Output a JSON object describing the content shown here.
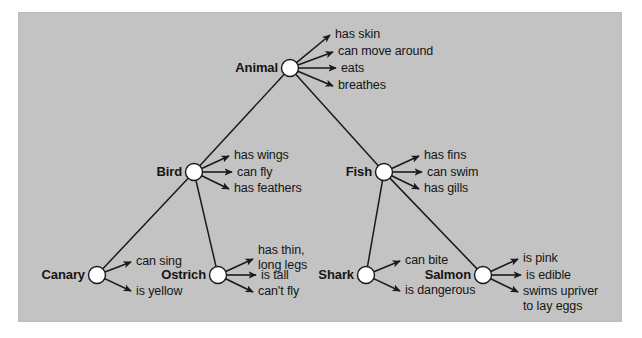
{
  "figure": {
    "type": "semantic-network-diagram",
    "panel": {
      "background_color": "#c3c3c3",
      "border_color": "#bcbcbc",
      "x": 18,
      "y": 12,
      "width": 604,
      "height": 310
    },
    "style": {
      "node_fill": "#ffffff",
      "node_stroke": "#1a1a1a",
      "line_color": "#1a1a1a",
      "text_color": "#151515",
      "node_radius": 8.5
    }
  },
  "nodes": [
    {
      "id": "animal",
      "label": "Animal",
      "x": 290,
      "y": 68,
      "label_x": 278,
      "label_y": 61,
      "level": 0
    },
    {
      "id": "bird",
      "label": "Bird",
      "x": 194,
      "y": 172,
      "label_x": 182,
      "label_y": 165,
      "level": 1
    },
    {
      "id": "fish",
      "label": "Fish",
      "x": 384,
      "y": 172,
      "label_x": 372,
      "label_y": 165,
      "level": 1
    },
    {
      "id": "canary",
      "label": "Canary",
      "x": 97,
      "y": 275,
      "label_x": 85,
      "label_y": 268,
      "level": 2
    },
    {
      "id": "ostrich",
      "label": "Ostrich",
      "x": 218,
      "y": 275,
      "label_x": 206,
      "label_y": 268,
      "level": 2
    },
    {
      "id": "shark",
      "label": "Shark",
      "x": 366,
      "y": 275,
      "label_x": 354,
      "label_y": 268,
      "level": 2
    },
    {
      "id": "salmon",
      "label": "Salmon",
      "x": 483,
      "y": 275,
      "label_x": 471,
      "label_y": 268,
      "level": 2
    }
  ],
  "isa_links": [
    {
      "from": "bird",
      "to": "animal"
    },
    {
      "from": "fish",
      "to": "animal"
    },
    {
      "from": "canary",
      "to": "bird"
    },
    {
      "from": "ostrich",
      "to": "bird"
    },
    {
      "from": "shark",
      "to": "fish"
    },
    {
      "from": "salmon",
      "to": "fish"
    }
  ],
  "properties": [
    {
      "node": "animal",
      "items": [
        {
          "text": "has skin",
          "tip_x": 330,
          "tip_y": 35,
          "text_x": 335,
          "text_y": 27
        },
        {
          "text": "can move around",
          "tip_x": 333,
          "tip_y": 52,
          "text_x": 338,
          "text_y": 44
        },
        {
          "text": "eats",
          "tip_x": 336,
          "tip_y": 68,
          "text_x": 341,
          "text_y": 61
        },
        {
          "text": "breathes",
          "tip_x": 333,
          "tip_y": 86,
          "text_x": 338,
          "text_y": 78
        }
      ]
    },
    {
      "node": "bird",
      "items": [
        {
          "text": "has wings",
          "tip_x": 229,
          "tip_y": 156,
          "text_x": 234,
          "text_y": 148
        },
        {
          "text": "can fly",
          "tip_x": 232,
          "tip_y": 172,
          "text_x": 237,
          "text_y": 165
        },
        {
          "text": "has feathers",
          "tip_x": 229,
          "tip_y": 189,
          "text_x": 234,
          "text_y": 181
        }
      ]
    },
    {
      "node": "fish",
      "items": [
        {
          "text": "has fins",
          "tip_x": 419,
          "tip_y": 156,
          "text_x": 424,
          "text_y": 148
        },
        {
          "text": "can swim",
          "tip_x": 422,
          "tip_y": 172,
          "text_x": 427,
          "text_y": 165
        },
        {
          "text": "has gills",
          "tip_x": 419,
          "tip_y": 189,
          "text_x": 424,
          "text_y": 181
        }
      ]
    },
    {
      "node": "canary",
      "items": [
        {
          "text": "can sing",
          "tip_x": 131,
          "tip_y": 262,
          "text_x": 136,
          "text_y": 254
        },
        {
          "text": "is yellow",
          "tip_x": 131,
          "tip_y": 291,
          "text_x": 136,
          "text_y": 284
        }
      ]
    },
    {
      "node": "ostrich",
      "items": [
        {
          "text": "has thin,\nlong legs",
          "tip_x": 253,
          "tip_y": 259,
          "text_x": 258,
          "text_y": 243
        },
        {
          "text": "is tall",
          "tip_x": 256,
          "tip_y": 275,
          "text_x": 261,
          "text_y": 268
        },
        {
          "text": "can't fly",
          "tip_x": 253,
          "tip_y": 292,
          "text_x": 258,
          "text_y": 284
        }
      ]
    },
    {
      "node": "shark",
      "items": [
        {
          "text": "can bite",
          "tip_x": 400,
          "tip_y": 261,
          "text_x": 405,
          "text_y": 253
        },
        {
          "text": "is dangerous",
          "tip_x": 400,
          "tip_y": 291,
          "text_x": 405,
          "text_y": 283
        }
      ]
    },
    {
      "node": "salmon",
      "items": [
        {
          "text": "is pink",
          "tip_x": 518,
          "tip_y": 259,
          "text_x": 523,
          "text_y": 251
        },
        {
          "text": "is edible",
          "tip_x": 521,
          "tip_y": 275,
          "text_x": 526,
          "text_y": 268
        },
        {
          "text": "swims upriver\nto lay eggs",
          "tip_x": 518,
          "tip_y": 292,
          "text_x": 523,
          "text_y": 284
        }
      ]
    }
  ]
}
